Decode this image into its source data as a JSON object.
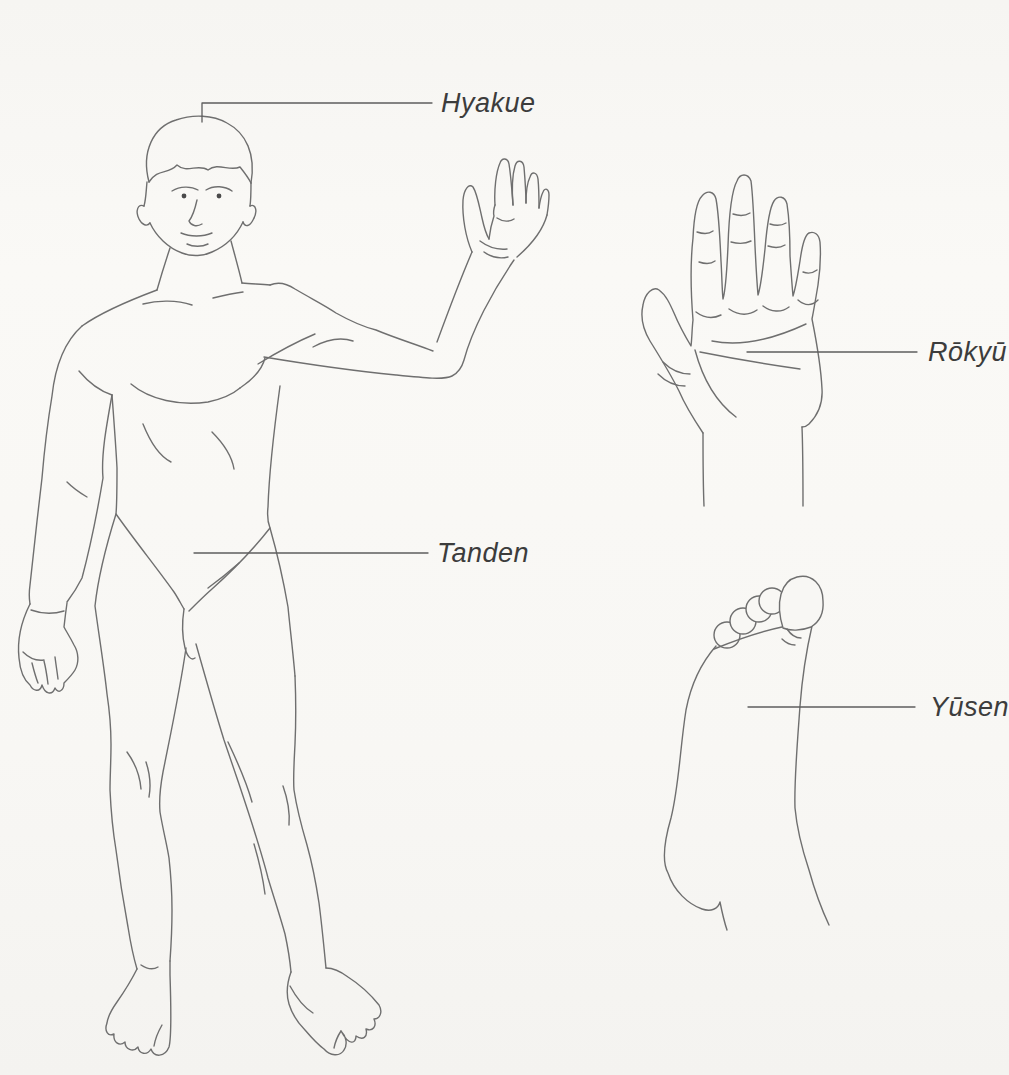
{
  "canvas": {
    "background": "#f8f7f4",
    "line_color": "#6f6f6f",
    "dot_color": "#1c1c1c",
    "label_color": "#3c3c3c"
  },
  "illustrations": {
    "body": "standing-male-figure-front-view-right-arm-raised",
    "hand": "open-palm-fingers-spread",
    "foot": "sole-of-foot-toes-up"
  },
  "annotations": {
    "hyakue": {
      "label": "Hyakue",
      "target": "crown-of-head"
    },
    "tanden": {
      "label": "Tanden",
      "target": "lower-abdomen"
    },
    "rokyu": {
      "label": "Rōkyū",
      "target": "center-of-palm"
    },
    "yusen": {
      "label": "Yūsen",
      "target": "sole-of-foot"
    }
  }
}
